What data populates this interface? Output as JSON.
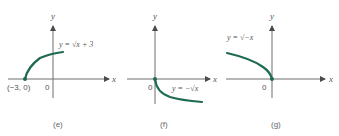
{
  "panels": [
    {
      "id": "e",
      "caption": "(e)",
      "equation": "y = √x + 3",
      "x_label": "x",
      "y_label": "y",
      "origin_label": "0",
      "point_label": "(−3, 0)",
      "curve_color": "#1f6b4f"
    },
    {
      "id": "f",
      "caption": "(f)",
      "equation": "y = −√x",
      "x_label": "x",
      "y_label": "y",
      "origin_label": "0",
      "curve_color": "#1f6b4f"
    },
    {
      "id": "g",
      "caption": "(g)",
      "equation": "y = √−x",
      "x_label": "x",
      "y_label": "y",
      "origin_label": "0",
      "curve_color": "#1f6b4f"
    }
  ]
}
